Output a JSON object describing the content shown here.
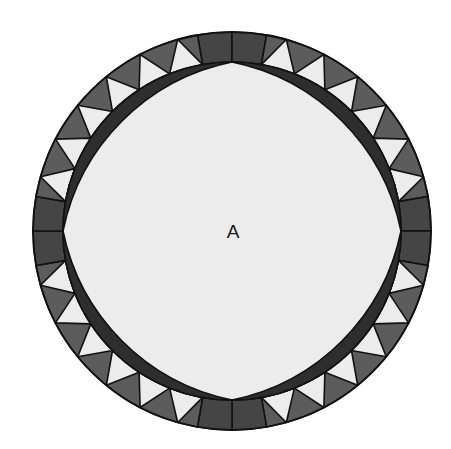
{
  "diagram": {
    "type": "quilt-block",
    "center_label": "A",
    "geometry": {
      "cx": 232,
      "cy": 231,
      "outer_radius": 199,
      "inner_radius": 169,
      "square_half_angle_deg": 10,
      "light_triangles_per_quadrant": 6,
      "squares_per_cardinal": 2,
      "lens_arc_radius": 216
    },
    "colors": {
      "background": "#ffffff",
      "center_fill": "#ececec",
      "lens_fill": "#2e2e2e",
      "square_fill": "#454545",
      "dark_triangle_fill": "#5c5c5c",
      "light_triangle_fill": "#ececec",
      "stroke": "#111111"
    },
    "regions": [
      {
        "name": "center-star",
        "label": "A"
      },
      {
        "name": "lens-top-right"
      },
      {
        "name": "lens-bottom-right"
      },
      {
        "name": "lens-bottom-left"
      },
      {
        "name": "lens-top-left"
      },
      {
        "name": "ring-border",
        "squares": 8,
        "light_triangles": 24
      }
    ]
  }
}
